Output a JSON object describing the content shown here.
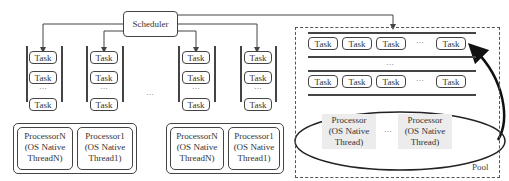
{
  "diagram": {
    "scheduler": {
      "label": "Scheduler"
    },
    "task_label": "Task",
    "ellipsis": "···",
    "columns": [
      {
        "tasks": [
          "Task",
          "Task",
          "···",
          "Task"
        ]
      },
      {
        "tasks": [
          "Task",
          "Task",
          "···",
          "Task"
        ]
      },
      {
        "tasks": [
          "Task",
          "Task",
          "···",
          "Task"
        ]
      },
      {
        "tasks": [
          "Task",
          "Task",
          "···",
          "Task"
        ]
      }
    ],
    "between_columns_ellipsis": "···",
    "processor_groups": [
      {
        "processors": [
          {
            "line1": "ProcessorN",
            "line2": "(OS Native",
            "line3": "ThreadN)"
          },
          {
            "line1": "Processor1",
            "line2": "(OS Native",
            "line3": "Thread1)"
          }
        ]
      },
      {
        "processors": [
          {
            "line1": "ProcessorN",
            "line2": "(OS Native",
            "line3": "ThreadN)"
          },
          {
            "line1": "Processor1",
            "line2": "(OS Native",
            "line3": "Thread1)"
          }
        ]
      }
    ],
    "pool": {
      "label": "Pool",
      "queue_rows": [
        {
          "tasks": [
            "Task",
            "Task",
            "Task",
            "···",
            "Task"
          ]
        },
        {
          "tasks": [
            "Task",
            "Task",
            "Task",
            "···",
            "Task"
          ]
        }
      ],
      "row_ellipsis": "···",
      "processors": [
        {
          "line1": "Processor",
          "line2": "(OS Native",
          "line3": "Thread)"
        },
        {
          "line1": "Processor",
          "line2": "(OS Native",
          "line3": "Thread)"
        }
      ],
      "processor_ellipsis": "···"
    }
  }
}
